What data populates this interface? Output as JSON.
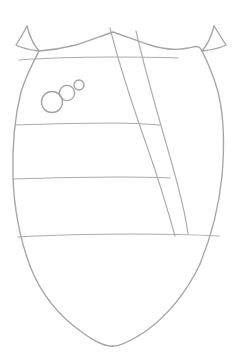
{
  "image": {
    "title": "Heraldic shield line drawing",
    "width": 241,
    "height": 359,
    "background_color": "#ffffff",
    "line_color": "#a7a4a4",
    "style": "uncolored outline sketch"
  },
  "drawing": {
    "subject": "coat-of-arms shield (escutcheon)",
    "shield": {
      "name": "shield-outline",
      "description": "Shield with notched cusped chief, bulging flanks and pointed ogee base",
      "apex_point": {
        "x": 113,
        "y": 346
      },
      "widest_left_x": 12,
      "widest_right_x": 229,
      "top_y": 26,
      "bottom_y": 346
    },
    "divisions": {
      "name": "horizontal-bars",
      "count": 4,
      "description": "Horizontal bar lines crossing the field",
      "lines_y": [
        58,
        124,
        178,
        236
      ]
    },
    "bend": {
      "name": "diagonal-band",
      "description": "Narrow diagonal band (bendlet) running from chief toward dexter base",
      "top_left": {
        "x": 110,
        "y": 28
      },
      "top_right": {
        "x": 136,
        "y": 30
      },
      "bottom_left": {
        "x": 174,
        "y": 236
      },
      "bottom_right": {
        "x": 187,
        "y": 234
      }
    },
    "roundels": {
      "name": "roundel-charges",
      "count": 3,
      "description": "Three circular charges in bend, decreasing in size",
      "items": [
        {
          "label": "large-roundel",
          "cx": 52,
          "cy": 102,
          "r": 10.5
        },
        {
          "label": "medium-roundel",
          "cx": 67,
          "cy": 93,
          "r": 7.6
        },
        {
          "label": "small-roundel",
          "cx": 79,
          "cy": 85,
          "r": 5.0
        }
      ]
    }
  }
}
